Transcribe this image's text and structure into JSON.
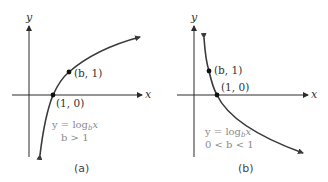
{
  "panels": [
    {
      "id": "a",
      "caption": "(a)",
      "x_axis_label": "x",
      "y_axis_label": "y",
      "points": [
        {
          "label": "(b, 1)"
        },
        {
          "label": "(1, 0)"
        }
      ],
      "equation": "y = log",
      "equation_sub": "b",
      "equation_var": "x",
      "condition": "b > 1"
    },
    {
      "id": "b",
      "caption": "(b)",
      "x_axis_label": "x",
      "y_axis_label": "y",
      "points": [
        {
          "label": "(b, 1)"
        },
        {
          "label": "(1, 0)"
        }
      ],
      "equation": "y = log",
      "equation_sub": "b",
      "equation_var": "x",
      "condition": "0 < b < 1"
    }
  ],
  "colors": {
    "axis": "#2a2a2a",
    "curve": "#3a3a3a",
    "equation_text": "#8a8a8a"
  }
}
